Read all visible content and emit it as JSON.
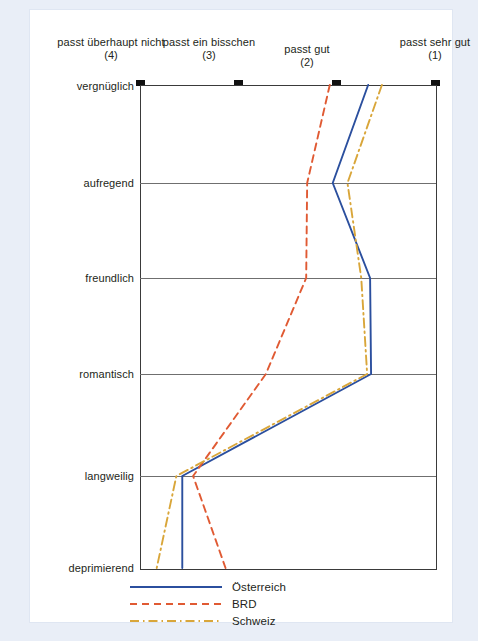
{
  "chart_data": {
    "type": "line",
    "title": "",
    "subtitle": "",
    "orientation": "horizontal-categories",
    "xlabel": "",
    "ylabel": "",
    "xlim": [
      4,
      1
    ],
    "grid": true,
    "legend_position": "bottom",
    "categories": [
      "vergnüglich",
      "aufregend",
      "freundlich",
      "romantisch",
      "langweilig",
      "deprimierend"
    ],
    "x_tick_values": [
      4,
      3,
      2,
      1
    ],
    "x_tick_labels": [
      {
        "text": "passt überhaupt nicht",
        "number": "(4)",
        "value": 4
      },
      {
        "text": "passt ein bisschen",
        "number": "(3)",
        "value": 3
      },
      {
        "text": "passt gut",
        "number": "(2)",
        "value": 2
      },
      {
        "text": "passt sehr gut",
        "number": "(1)",
        "value": 1
      }
    ],
    "series": [
      {
        "name": "Österreich",
        "color": "#2b4f9e",
        "dash": "solid",
        "values": [
          1.68,
          2.04,
          1.66,
          1.65,
          3.57,
          3.57
        ]
      },
      {
        "name": "BRD",
        "color": "#e05a33",
        "dash": "dashed",
        "values": [
          2.07,
          2.3,
          2.31,
          2.72,
          3.46,
          3.13
        ]
      },
      {
        "name": "Schweiz",
        "color": "#d9a63a",
        "dash": "dash-dot",
        "values": [
          1.54,
          1.89,
          1.75,
          1.69,
          3.63,
          3.83
        ]
      }
    ]
  },
  "legend": {
    "items": [
      {
        "label": "Österreich"
      },
      {
        "label": "BRD"
      },
      {
        "label": "Schweiz"
      }
    ]
  },
  "colors": {
    "osterreich": "#2b4f9e",
    "brd": "#e05a33",
    "schweiz": "#d9a63a",
    "axis": "#3a3a3a",
    "grid": "#6f6f6f",
    "text": "#231f20",
    "page_background": "#e9eef7",
    "card_background": "#ffffff"
  }
}
